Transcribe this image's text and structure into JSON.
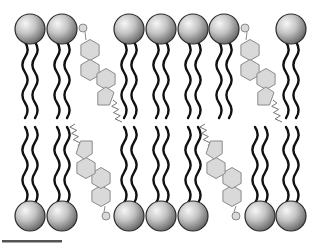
{
  "diagram": {
    "colors": {
      "head_light": "#f5f5f5",
      "head_dark": "#6e6e6e",
      "head_outline": "#2a2a2a",
      "tail": "#111111",
      "cholesterol_fill": "#d9d9d9",
      "cholesterol_outline": "#8a8a8a",
      "scale_bar": "#555555"
    },
    "top_leaflet": {
      "phospholipid_heads_x": [
        30,
        62,
        129,
        161,
        193,
        224,
        291
      ],
      "head_y": 29,
      "head_radius": 15,
      "cholesterol": [
        {
          "oh": [
            83,
            28
          ],
          "rings": [
            [
              90,
              50
            ],
            [
              90,
              70
            ],
            [
              106,
              79
            ]
          ],
          "pentagon": [
            105,
            96
          ],
          "tail_start": [
            113,
            100
          ]
        },
        {
          "oh": [
            245,
            28
          ],
          "rings": [
            [
              250,
              50
            ],
            [
              250,
              70
            ],
            [
              266,
              79
            ]
          ],
          "pentagon": [
            265,
            96
          ],
          "tail_start": [
            273,
            100
          ]
        }
      ]
    },
    "bottom_leaflet": {
      "phospholipid_heads_x": [
        30,
        62,
        129,
        161,
        193,
        260,
        291
      ],
      "head_y": 216,
      "head_radius": 15,
      "cholesterol": [
        {
          "oh": [
            106,
            216
          ],
          "rings": [
            [
              101,
              196
            ],
            [
              101,
              178
            ],
            [
              86,
              168
            ]
          ],
          "pentagon": [
            85,
            150
          ],
          "tail_start": [
            78,
            146
          ]
        },
        {
          "oh": [
            236,
            216
          ],
          "rings": [
            [
              232,
              196
            ],
            [
              232,
              178
            ],
            [
              216,
              168
            ]
          ],
          "pentagon": [
            215,
            150
          ],
          "tail_start": [
            208,
            146
          ]
        }
      ]
    },
    "scale_bar": {
      "x1": 2,
      "x2": 62,
      "y": 241
    }
  }
}
